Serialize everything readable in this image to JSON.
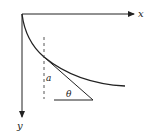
{
  "diagram": {
    "type": "curve-with-tangent",
    "axes": {
      "origin": [
        22,
        14
      ],
      "x_axis": {
        "label": "x",
        "direction": "right",
        "end": [
          135,
          14
        ]
      },
      "y_axis": {
        "label": "y",
        "direction": "down",
        "end": [
          22,
          118
        ]
      }
    },
    "curve": {
      "description": "decreasing concave curve from origin",
      "start": [
        22,
        14
      ],
      "end": [
        125,
        86
      ]
    },
    "dashed_line": {
      "label": "vertical reference line",
      "x": 44,
      "y_start": 37,
      "y_end": 99
    },
    "tangent_line": {
      "start": [
        44,
        57
      ],
      "end": [
        93,
        100
      ]
    },
    "base_line": {
      "start": [
        54,
        100
      ],
      "end": [
        93,
        100
      ]
    },
    "labels": {
      "x": "x",
      "y": "y",
      "a": "a",
      "theta": "θ"
    },
    "colors": {
      "stroke": "#222222",
      "background": "#ffffff"
    }
  }
}
